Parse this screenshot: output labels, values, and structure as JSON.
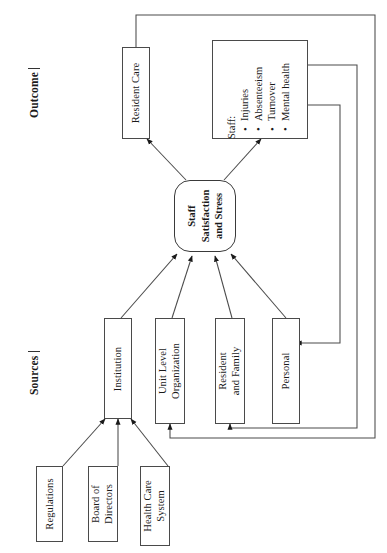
{
  "figure": {
    "sections": [
      {
        "id": "outcome",
        "label": "Outcome"
      },
      {
        "id": "sources",
        "label": "Sources"
      }
    ],
    "core_node": {
      "name": "staff-satisfaction-and-stress",
      "lines": [
        "Staff",
        "Satisfaction",
        "and Stress"
      ]
    },
    "outcome_nodes": [
      {
        "name": "resident-care",
        "lines": [
          "Resident Care"
        ]
      }
    ],
    "staff_outcome": {
      "name": "staff-outcomes",
      "title": "Staff:",
      "items": [
        "Injuries",
        "Absenteeism",
        "Turnover",
        "Mental health"
      ]
    },
    "source_nodes": [
      {
        "name": "institution",
        "lines": [
          "Institution"
        ]
      },
      {
        "name": "unit-level-organization",
        "lines": [
          "Unit Level",
          "Organization"
        ]
      },
      {
        "name": "resident-and-family",
        "lines": [
          "Resident",
          "and Family"
        ]
      },
      {
        "name": "personal",
        "lines": [
          "Personal"
        ]
      }
    ],
    "institution_inputs": [
      {
        "name": "regulations",
        "lines": [
          "Regulations"
        ]
      },
      {
        "name": "board-of-directors",
        "lines": [
          "Board of",
          "Directors"
        ]
      },
      {
        "name": "health-care-system",
        "lines": [
          "Health Care",
          "System"
        ]
      }
    ],
    "colors": {
      "stroke": "#4a4a4a",
      "text": "#1a1a1a",
      "background": "#ffffff"
    }
  }
}
